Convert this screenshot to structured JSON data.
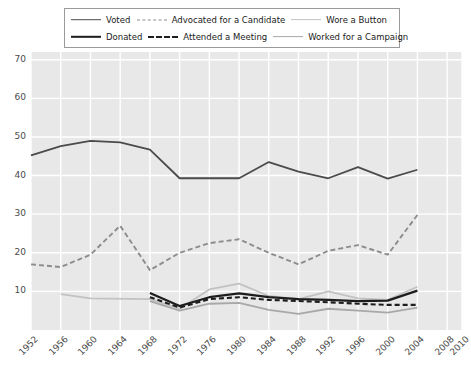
{
  "legend": {
    "position": "top",
    "rows": [
      [
        {
          "label": "Voted",
          "style": "solid",
          "color": "#4b4b4b",
          "key": "voted"
        },
        {
          "label": "Advocated for a Candidate",
          "style": "dashed",
          "color": "#8c8c8c",
          "key": "advocated"
        },
        {
          "label": "Wore a Button",
          "style": "solid",
          "color": "#c2c2c2",
          "key": "wore_button"
        }
      ],
      [
        {
          "label": "Donated",
          "style": "solid",
          "color": "#1d1d1d",
          "key": "donated"
        },
        {
          "label": "Attended a Meeting",
          "style": "dashed",
          "color": "#1d1d1d",
          "key": "attended"
        },
        {
          "label": "Worked for a Campaign",
          "style": "solid",
          "color": "#a8a8a8",
          "key": "worked"
        }
      ]
    ]
  },
  "chart_data": {
    "type": "line",
    "title": "",
    "xlabel": "",
    "ylabel": "",
    "grid": true,
    "legend_position": "top",
    "xlim": [
      1952,
      2010
    ],
    "ylim": [
      0,
      72
    ],
    "yticks": [
      10,
      20,
      30,
      40,
      50,
      60,
      70
    ],
    "xticks": [
      1952,
      1956,
      1960,
      1964,
      1968,
      1972,
      1976,
      1980,
      1984,
      1988,
      1992,
      1996,
      2000,
      2004,
      2008,
      2010
    ],
    "plot_background": "#e8e8e8",
    "gridline_color": "#ffffff",
    "series": [
      {
        "name": "Voted",
        "color": "#4b4b4b",
        "style": "solid",
        "width": 1.8,
        "x": [
          1952,
          1956,
          1960,
          1964,
          1968,
          1972,
          1976,
          1980,
          1984,
          1988,
          1992,
          1996,
          2000,
          2004
        ],
        "values": [
          45.2,
          47.6,
          49.0,
          48.6,
          46.7,
          39.3,
          39.3,
          39.3,
          43.5,
          41.0,
          39.3,
          42.2,
          39.2,
          41.5
        ]
      },
      {
        "name": "Advocated for a Candidate",
        "color": "#8c8c8c",
        "style": "dashed",
        "width": 1.9,
        "x": [
          1952,
          1956,
          1960,
          1964,
          1968,
          1972,
          1976,
          1980,
          1984,
          1988,
          1992,
          1996,
          2000,
          2004
        ],
        "values": [
          17.0,
          16.3,
          19.5,
          27.0,
          15.5,
          20.0,
          22.5,
          23.5,
          20.0,
          17.0,
          20.5,
          22.0,
          19.5,
          29.8
        ]
      },
      {
        "name": "Wore a Button",
        "color": "#c2c2c2",
        "style": "solid",
        "width": 1.8,
        "x": [
          1956,
          1960,
          1968,
          1972,
          1976,
          1980,
          1984,
          1988,
          1992,
          1996,
          2000,
          2004
        ],
        "values": [
          9.3,
          8.2,
          8.0,
          5.5,
          10.5,
          12.0,
          8.8,
          8.0,
          10.0,
          8.2,
          7.8,
          11.2
        ]
      },
      {
        "name": "Donated",
        "color": "#1d1d1d",
        "style": "solid",
        "width": 2.2,
        "x": [
          1968,
          1972,
          1976,
          1980,
          1984,
          1988,
          1992,
          1996,
          2000,
          2004
        ],
        "values": [
          9.6,
          6.2,
          8.5,
          9.5,
          8.5,
          8.0,
          7.8,
          7.5,
          7.6,
          10.2
        ]
      },
      {
        "name": "Attended a Meeting",
        "color": "#1d1d1d",
        "style": "dashed",
        "width": 2.1,
        "x": [
          1968,
          1972,
          1976,
          1980,
          1984,
          1988,
          1992,
          1996,
          2000,
          2004
        ],
        "values": [
          8.5,
          5.8,
          8.0,
          8.5,
          7.8,
          7.5,
          7.2,
          6.8,
          6.5,
          6.5
        ]
      },
      {
        "name": "Worked for a Campaign",
        "color": "#a8a8a8",
        "style": "solid",
        "width": 1.8,
        "x": [
          1968,
          1972,
          1976,
          1980,
          1984,
          1988,
          1992,
          1996,
          2000,
          2004
        ],
        "values": [
          7.5,
          5.0,
          6.8,
          7.0,
          5.2,
          4.2,
          5.5,
          5.0,
          4.5,
          5.8
        ]
      }
    ]
  }
}
